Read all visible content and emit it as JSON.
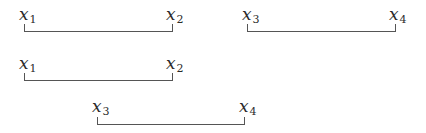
{
  "diagram": {
    "rows": [
      {
        "intervals": [
          {
            "start_label": {
              "var": "x",
              "sub": "1"
            },
            "end_label": {
              "var": "x",
              "sub": "2"
            }
          },
          {
            "start_label": {
              "var": "x",
              "sub": "3"
            },
            "end_label": {
              "var": "x",
              "sub": "4"
            }
          }
        ]
      },
      {
        "intervals": [
          {
            "start_label": {
              "var": "x",
              "sub": "1"
            },
            "end_label": {
              "var": "x",
              "sub": "2"
            }
          }
        ]
      },
      {
        "intervals": [
          {
            "start_label": {
              "var": "x",
              "sub": "3"
            },
            "end_label": {
              "var": "x",
              "sub": "4"
            }
          }
        ]
      }
    ],
    "colors": {
      "line": "#555555",
      "text": "#2b2b2b"
    }
  }
}
